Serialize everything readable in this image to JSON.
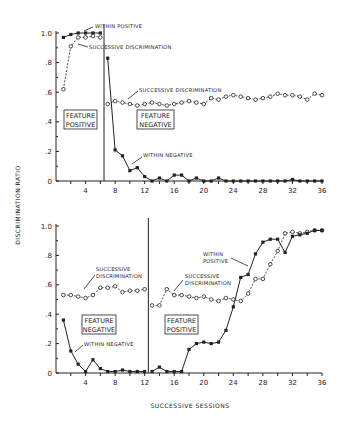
{
  "chart_data": [
    {
      "type": "line",
      "panel": "top",
      "xlabel": "SUCCESSIVE SESSIONS",
      "ylabel": "DISCRIMINATION RATIO",
      "xlim": [
        0,
        36
      ],
      "ylim": [
        0,
        1.0
      ],
      "x_ticks": [
        4,
        8,
        12,
        16,
        20,
        24,
        28,
        32,
        36
      ],
      "y_ticks": [
        0,
        0.2,
        0.4,
        0.6,
        0.8,
        1.0
      ],
      "y_tick_labels": [
        "0",
        ".2",
        ".4",
        ".6",
        ".8",
        "1.0"
      ],
      "phase_divider_session": 6.5,
      "phases": [
        {
          "label_line1": "FEATURE",
          "label_line2": "POSITIVE"
        },
        {
          "label_line1": "FEATURE",
          "label_line2": "NEGATIVE"
        }
      ],
      "series": [
        {
          "name": "WITHIN POSITIVE",
          "marker": "filled",
          "line": "solid",
          "x": [
            1,
            2,
            3,
            4,
            5,
            6
          ],
          "values": [
            0.97,
            0.99,
            1.0,
            1.0,
            1.0,
            1.0
          ]
        },
        {
          "name": "SUCCESSIVE DISCRIMINATION",
          "marker": "open",
          "line": "dashed",
          "x": [
            1,
            2,
            3,
            4,
            5,
            6
          ],
          "values": [
            0.62,
            0.91,
            0.97,
            0.97,
            0.98,
            0.97
          ]
        },
        {
          "name": "SUCCESSIVE DISCRIMINATION",
          "marker": "open",
          "line": "dashed",
          "x": [
            7,
            8,
            9,
            10,
            11,
            12,
            13,
            14,
            15,
            16,
            17,
            18,
            19,
            20,
            21,
            22,
            23,
            24,
            25,
            26,
            27,
            28,
            29,
            30,
            31,
            32,
            33,
            34,
            35,
            36
          ],
          "values": [
            0.52,
            0.54,
            0.53,
            0.52,
            0.51,
            0.52,
            0.53,
            0.52,
            0.51,
            0.52,
            0.53,
            0.54,
            0.53,
            0.52,
            0.56,
            0.55,
            0.57,
            0.58,
            0.57,
            0.56,
            0.55,
            0.56,
            0.57,
            0.59,
            0.58,
            0.58,
            0.57,
            0.55,
            0.59,
            0.58
          ]
        },
        {
          "name": "WITHIN NEGATIVE",
          "marker": "filled",
          "line": "solid",
          "x": [
            7,
            8,
            9,
            10,
            11,
            12,
            13,
            14,
            15,
            16,
            17,
            18,
            19,
            20,
            21,
            22,
            23,
            24,
            25,
            26,
            27,
            28,
            29,
            30,
            31,
            32,
            33,
            34,
            35,
            36
          ],
          "values": [
            0.83,
            0.21,
            0.17,
            0.07,
            0.09,
            0.03,
            0.0,
            0.02,
            0.0,
            0.04,
            0.04,
            0.0,
            0.02,
            0.0,
            0.0,
            0.02,
            0.0,
            0.0,
            0.0,
            0.0,
            0.0,
            0.0,
            0.0,
            0.0,
            0.0,
            0.01,
            0.0,
            0.0,
            0.0,
            0.0
          ]
        }
      ],
      "annotations": [
        "WITHIN POSITIVE",
        "SUCCESSIVE DISCRIMINATION",
        "SUCCESSIVE DISCRIMINATION",
        "WITHIN NEGATIVE"
      ]
    },
    {
      "type": "line",
      "panel": "bottom",
      "xlabel": "SUCCESSIVE SESSIONS",
      "ylabel": "DISCRIMINATION RATIO",
      "xlim": [
        0,
        36
      ],
      "ylim": [
        0,
        1.0
      ],
      "x_ticks": [
        4,
        8,
        12,
        16,
        20,
        24,
        28,
        32,
        36
      ],
      "y_ticks": [
        0,
        0.2,
        0.4,
        0.6,
        0.8,
        1.0
      ],
      "y_tick_labels": [
        "0",
        ".2",
        ".4",
        ".6",
        ".8",
        "1.0"
      ],
      "phase_divider_session": 12.5,
      "phases": [
        {
          "label_line1": "FEATURE",
          "label_line2": "NEGATIVE"
        },
        {
          "label_line1": "FEATURE",
          "label_line2": "POSITIVE"
        }
      ],
      "series": [
        {
          "name": "SUCCESSIVE DISCRIMINATION",
          "marker": "open",
          "line": "dashed",
          "x": [
            1,
            2,
            3,
            4,
            5,
            6,
            7,
            8,
            9,
            10,
            11,
            12
          ],
          "values": [
            0.53,
            0.53,
            0.52,
            0.51,
            0.53,
            0.58,
            0.58,
            0.59,
            0.55,
            0.56,
            0.56,
            0.57
          ]
        },
        {
          "name": "WITHIN NEGATIVE",
          "marker": "filled",
          "line": "solid",
          "x": [
            1,
            2,
            3,
            4,
            5,
            6,
            7,
            8,
            9,
            10,
            11,
            12
          ],
          "values": [
            0.36,
            0.15,
            0.06,
            0.01,
            0.09,
            0.03,
            0.01,
            0.01,
            0.02,
            0.01,
            0.01,
            0.01
          ]
        },
        {
          "name": "SUCCESSIVE DISCRIMINATION",
          "marker": "open",
          "line": "dashed",
          "x": [
            13,
            14,
            15,
            16,
            17,
            18,
            19,
            20,
            21,
            22,
            23,
            24,
            25,
            26,
            27,
            28,
            29,
            30,
            31,
            32,
            33,
            34,
            35,
            36
          ],
          "values": [
            0.46,
            0.46,
            0.57,
            0.53,
            0.53,
            0.52,
            0.51,
            0.52,
            0.5,
            0.49,
            0.51,
            0.5,
            0.49,
            0.54,
            0.64,
            0.64,
            0.74,
            0.83,
            0.95,
            0.96,
            0.95,
            0.96,
            0.97,
            0.97
          ]
        },
        {
          "name": "WITHIN POSITIVE",
          "marker": "filled",
          "line": "solid",
          "x": [
            13,
            14,
            15,
            16,
            17,
            18,
            19,
            20,
            21,
            22,
            23,
            24,
            25,
            26,
            27,
            28,
            29,
            30,
            31,
            32,
            33,
            34,
            35,
            36
          ],
          "values": [
            0.01,
            0.04,
            0.01,
            0.01,
            0.01,
            0.16,
            0.2,
            0.21,
            0.2,
            0.21,
            0.29,
            0.45,
            0.65,
            0.67,
            0.81,
            0.89,
            0.91,
            0.91,
            0.82,
            0.93,
            0.94,
            0.95,
            0.97,
            0.97
          ]
        }
      ],
      "annotations": [
        "SUCCESSIVE DISCRIMINATION",
        "WITHIN NEGATIVE",
        "WITHIN POSITIVE",
        "SUCCESSIVE DISCRIMINATION"
      ]
    }
  ],
  "labels": {
    "y_axis": "DISCRIMINATION RATIO",
    "x_axis": "SUCCESSIVE SESSIONS",
    "top": {
      "within_positive": "WITHIN POSITIVE",
      "succ_disc_1": "SUCCESSIVE DISCRIMINATION",
      "succ_disc_2": "SUCCESSIVE DISCRIMINATION",
      "within_negative": "WITHIN NEGATIVE",
      "box1_l1": "FEATURE",
      "box1_l2": "POSITIVE",
      "box2_l1": "FEATURE",
      "box2_l2": "NEGATIVE"
    },
    "bottom": {
      "succ_disc_1_l1": "SUCCESSIVE",
      "succ_disc_1_l2": "DISCRIMINATION",
      "within_negative": "WITHIN NEGATIVE",
      "within_positive_l1": "WITHIN",
      "within_positive_l2": "POSITIVE",
      "succ_disc_2_l1": "SUCCESSIVE",
      "succ_disc_2_l2": "DISCRIMINATION",
      "box1_l1": "FEATURE",
      "box1_l2": "NEGATIVE",
      "box2_l1": "FEATURE",
      "box2_l2": "POSITIVE"
    }
  }
}
